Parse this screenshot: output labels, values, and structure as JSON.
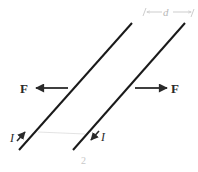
{
  "diagram": {
    "colors": {
      "wire": "#1a1a1a",
      "arrow": "#2a2a2a",
      "faint": "#c0c0c0"
    },
    "wires": [
      {
        "id": "wire-left",
        "x1": 132,
        "y1": 23,
        "x2": 19,
        "y2": 150,
        "current_label": "I",
        "current_direction": "up"
      },
      {
        "id": "wire-right",
        "x1": 185,
        "y1": 23,
        "x2": 73,
        "y2": 150,
        "current_label": "I",
        "current_direction": "down"
      }
    ],
    "forces": [
      {
        "label": "F",
        "direction": "left"
      },
      {
        "label": "F",
        "direction": "right"
      }
    ],
    "separation": {
      "label": "d"
    },
    "stray_mark": "2"
  }
}
